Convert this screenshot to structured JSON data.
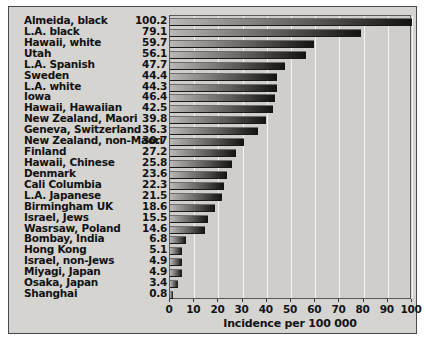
{
  "chart_data": {
    "type": "bar",
    "orientation": "horizontal",
    "title": "",
    "xlabel": "Incidence per 100 000",
    "ylabel": "",
    "xlim": [
      0,
      100
    ],
    "xticks": [
      0,
      10,
      20,
      30,
      40,
      50,
      60,
      70,
      80,
      90,
      100
    ],
    "grid": true,
    "legend": null,
    "value_labels_shown": true,
    "categories": [
      "Almeida, black",
      "L.A. black",
      "Hawaii, white",
      "Utah",
      "L.A. Spanish",
      "Sweden",
      "L.A. white",
      "Iowa",
      "Hawaii, Hawaiian",
      "New Zealand, Maori",
      "Geneva, Switzerland",
      "New Zealand, non-Maori",
      "Finland",
      "Hawaii, Chinese",
      "Denmark",
      "Cali Columbia",
      "L.A. Japanese",
      "Birmingham UK",
      "Israel, Jews",
      "Wasrsaw, Poland",
      "Bombay, India",
      "Hong Kong",
      "Israel, non-Jews",
      "Miyagi, Japan",
      "Osaka, Japan",
      "Shanghai"
    ],
    "values": [
      100.2,
      79.1,
      59.7,
      56.1,
      47.7,
      44.4,
      44.3,
      46.4,
      42.5,
      39.8,
      36.3,
      30.7,
      27.2,
      25.8,
      23.6,
      22.3,
      21.5,
      18.6,
      15.5,
      14.6,
      6.8,
      5.1,
      4.9,
      4.9,
      3.4,
      0.8
    ],
    "bar_lengths": [
      100.2,
      79.1,
      59.7,
      56.1,
      47.7,
      44.4,
      44.3,
      43.4,
      42.5,
      39.8,
      36.3,
      30.7,
      27.2,
      25.8,
      23.6,
      22.3,
      21.5,
      18.6,
      15.5,
      14.6,
      6.8,
      5.1,
      4.9,
      4.9,
      3.4,
      0.8
    ]
  },
  "colors": {
    "panel_background": "#d5d4d1",
    "plot_background": "#cfcecb",
    "gridline": "#f4f4f2",
    "bar_light": "#b9b8b5",
    "bar_dark": "#131312",
    "text": "#121212",
    "border": "#4a4a4a"
  }
}
